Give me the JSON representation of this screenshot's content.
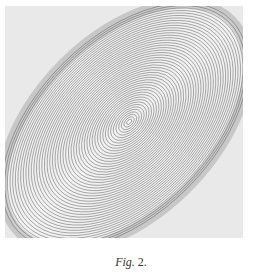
{
  "figure": {
    "caption_label": "Fig.",
    "caption_number": "2.",
    "image_description": "Photograph of elliptical concentric interference fringes tilted diagonally",
    "colors": {
      "background": "#e9e9e9",
      "fringe": "#555555",
      "shadow": "#8a8a8a"
    }
  }
}
